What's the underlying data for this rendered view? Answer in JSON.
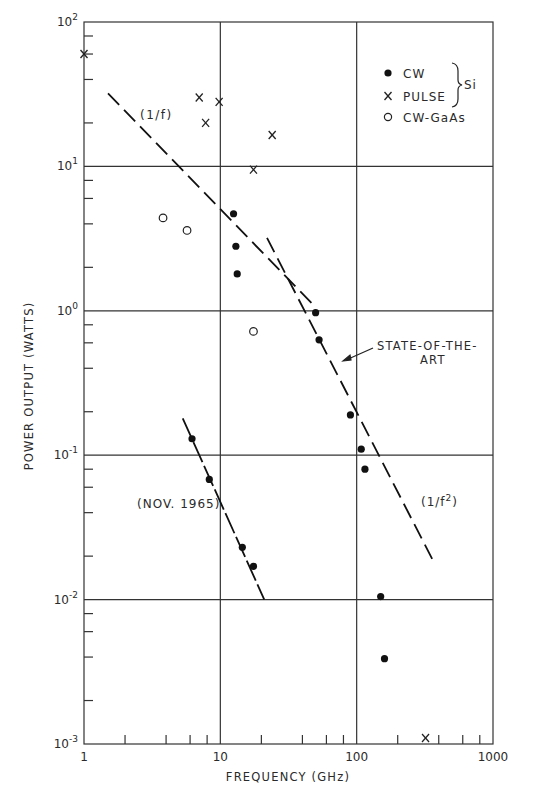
{
  "chart_data": {
    "type": "scatter",
    "title": "",
    "xlabel": "FREQUENCY (GHz)",
    "ylabel": "POWER OUTPUT (WATTS)",
    "xscale": "log",
    "yscale": "log",
    "xlim": [
      1,
      1000
    ],
    "ylim": [
      0.001,
      100
    ],
    "grid": true,
    "x_ticks": [
      "1",
      "10",
      "100",
      "1000"
    ],
    "y_ticks": [
      "10^-3",
      "10^-2",
      "10^-1",
      "10^0",
      "10^1",
      "10^2"
    ],
    "legend": {
      "position": "upper right",
      "entries": [
        {
          "marker": "filled-circle",
          "label": "CW"
        },
        {
          "marker": "x",
          "label": "PULSE"
        },
        {
          "marker": "open-circle",
          "label": "CW-GaAs"
        }
      ],
      "group_label": "Si",
      "group_applies_to": [
        "CW",
        "PULSE"
      ]
    },
    "series": [
      {
        "name": "CW",
        "marker": "filled-circle",
        "points": [
          [
            12.5,
            4.7
          ],
          [
            13,
            2.8
          ],
          [
            13.3,
            1.8
          ],
          [
            50,
            0.97
          ],
          [
            53,
            0.63
          ],
          [
            90,
            0.19
          ],
          [
            108,
            0.11
          ],
          [
            115,
            0.08
          ],
          [
            150,
            0.0105
          ],
          [
            160,
            0.0039
          ],
          [
            6.2,
            0.13
          ],
          [
            8.3,
            0.068
          ],
          [
            14.5,
            0.023
          ],
          [
            17.5,
            0.017
          ]
        ]
      },
      {
        "name": "PULSE",
        "marker": "x",
        "points": [
          [
            1,
            60
          ],
          [
            7,
            30
          ],
          [
            7.8,
            20
          ],
          [
            9.8,
            28
          ],
          [
            17.5,
            9.5
          ],
          [
            24,
            16.5
          ],
          [
            320,
            0.0011
          ]
        ]
      },
      {
        "name": "CW-GaAs",
        "marker": "open-circle",
        "points": [
          [
            3.8,
            4.4
          ],
          [
            5.7,
            3.6
          ],
          [
            17.5,
            0.72
          ]
        ]
      }
    ],
    "lines": [
      {
        "name": "(1/f)",
        "style": "dashed",
        "from": [
          1.5,
          32
        ],
        "to": [
          48,
          1.1
        ]
      },
      {
        "name": "(1/f²)",
        "style": "dashed",
        "from": [
          22,
          3.2
        ],
        "to": [
          370,
          0.018
        ]
      },
      {
        "name": "(NOV. 1965)",
        "style": "dashed",
        "from": [
          5.3,
          0.18
        ],
        "to": [
          21,
          0.01
        ]
      }
    ],
    "annotations": [
      {
        "text": "(1/f)",
        "at": [
          4,
          23
        ]
      },
      {
        "text": "(1/f²)",
        "at": [
          220,
          0.045
        ]
      },
      {
        "text": "(NOV. 1965)",
        "at": [
          3.5,
          0.05
        ]
      },
      {
        "text": "STATE-OF-THE-ART",
        "at": [
          150,
          0.55
        ],
        "arrow_to": [
          58,
          0.32
        ]
      }
    ]
  },
  "labels": {
    "xlabel": "FREQUENCY  (GHz)",
    "ylabel": "POWER  OUTPUT  (WATTS)",
    "x_ticks": [
      "1",
      "10",
      "100",
      "1000"
    ],
    "y_tick_base": "10",
    "y_tick_exps": [
      "2",
      "1",
      "0",
      "-1",
      "-2",
      "-3"
    ],
    "legend": {
      "cw": "CW",
      "pulse": "PULSE",
      "gaas": "CW-GaAs",
      "si": "Si"
    },
    "ann_1f": "(1/f)",
    "ann_1f2": "(1/f",
    "ann_1f2_sup": "2",
    "ann_1f2_close": ")",
    "ann_nov": "(NOV. 1965)",
    "ann_state1": "STATE-OF-THE-",
    "ann_state2": "ART"
  }
}
